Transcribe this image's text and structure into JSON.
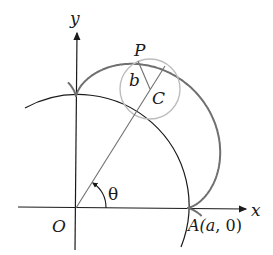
{
  "diagram": {
    "labels": {
      "y_axis": "y",
      "x_axis": "x",
      "origin": "O",
      "point_P": "P",
      "radius_b": "b",
      "center_C": "C",
      "angle": "θ",
      "point_A": "A(a, 0)"
    },
    "colors": {
      "axes": "#1a1a1a",
      "fixed_circle": "#1a1a1a",
      "epicycloid": "#707070",
      "rolling_circle": "#bdbdbd",
      "lines": "#707070"
    }
  }
}
